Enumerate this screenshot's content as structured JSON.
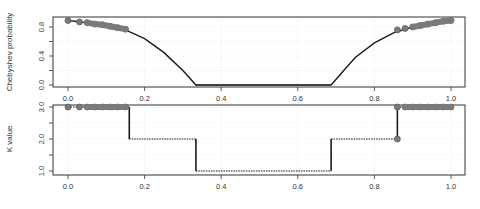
{
  "chart_data": [
    {
      "type": "line",
      "panel": "top",
      "title": "",
      "xlabel": "",
      "ylabel": "Chebyshev probability",
      "xlim": [
        -0.04,
        1.04
      ],
      "ylim": [
        0.0,
        0.9
      ],
      "x_ticks": [
        "0.0",
        "0.2",
        "0.4",
        "0.6",
        "0.8",
        "1.0"
      ],
      "y_ticks": [
        "0.0",
        "0.4",
        "0.8"
      ],
      "y_minor_ticks": [
        0.2,
        0.6
      ],
      "grid": true,
      "series": [
        {
          "name": "Chebyshev probability curve",
          "style": "solid",
          "x": [
            0.0,
            0.05,
            0.1,
            0.15,
            0.2,
            0.25,
            0.3,
            0.334,
            0.4,
            0.5,
            0.6,
            0.687,
            0.72,
            0.75,
            0.8,
            0.85,
            0.9,
            0.95,
            1.0
          ],
          "y": [
            0.89,
            0.86,
            0.82,
            0.76,
            0.64,
            0.45,
            0.2,
            0.0,
            0.0,
            0.0,
            0.0,
            0.0,
            0.2,
            0.38,
            0.58,
            0.72,
            0.8,
            0.86,
            0.89
          ]
        },
        {
          "name": "zero segment",
          "style": "dotted",
          "x": [
            0.334,
            0.687
          ],
          "y": [
            0.0,
            0.0
          ]
        },
        {
          "name": "sample points (left)",
          "style": "markers",
          "x": [
            0.0,
            0.03,
            0.05,
            0.07,
            0.09,
            0.11,
            0.13,
            0.15
          ],
          "y": [
            0.89,
            0.87,
            0.86,
            0.84,
            0.83,
            0.81,
            0.79,
            0.77
          ]
        },
        {
          "name": "sample points (right)",
          "style": "markers",
          "x": [
            0.86,
            0.88,
            0.9,
            0.92,
            0.94,
            0.96,
            0.98,
            1.0
          ],
          "y": [
            0.76,
            0.78,
            0.8,
            0.82,
            0.84,
            0.86,
            0.88,
            0.89
          ]
        }
      ]
    },
    {
      "type": "line",
      "panel": "bottom",
      "title": "",
      "xlabel": "",
      "ylabel": "K value",
      "xlim": [
        -0.04,
        1.04
      ],
      "ylim": [
        1.0,
        3.0
      ],
      "x_ticks": [
        "0.0",
        "0.2",
        "0.4",
        "0.6",
        "0.8",
        "1.0"
      ],
      "y_ticks": [
        "1.0",
        "2.0",
        "3.0"
      ],
      "y_minor_ticks": [
        1.5,
        2.5
      ],
      "grid": true,
      "series": [
        {
          "name": "K step function",
          "style": "step",
          "x": [
            0.0,
            0.16,
            0.16,
            0.334,
            0.334,
            0.687,
            0.687,
            0.86,
            0.86,
            1.0
          ],
          "y": [
            3,
            3,
            2,
            2,
            1,
            1,
            2,
            2,
            3,
            3
          ]
        },
        {
          "name": "sample points (left)",
          "style": "markers",
          "x": [
            0.0,
            0.03,
            0.05,
            0.07,
            0.09,
            0.11,
            0.13,
            0.15
          ],
          "y": [
            3,
            3,
            3,
            3,
            3,
            3,
            3,
            3
          ]
        },
        {
          "name": "sample points (right)",
          "style": "markers",
          "x": [
            0.86,
            0.86,
            0.88,
            0.9,
            0.92,
            0.94,
            0.96,
            0.98,
            1.0
          ],
          "y": [
            2,
            3,
            3,
            3,
            3,
            3,
            3,
            3,
            3
          ]
        }
      ]
    }
  ],
  "panels": {
    "top": {
      "ylabel": "Chebyshev probability",
      "y_ticks": [
        "0.8",
        "0.4",
        "0.0"
      ]
    },
    "bottom": {
      "ylabel": "K value",
      "y_ticks": [
        "3.0",
        "2.0",
        "1.0"
      ]
    },
    "x_ticks": [
      "0.0",
      "0.2",
      "0.4",
      "0.6",
      "0.8",
      "1.0"
    ]
  },
  "colors": {
    "line": "#1a1a1a",
    "marker_fill": "#7a7a7a",
    "marker_edge": "#555555",
    "frame": "#333333",
    "grid": "#e6e6e6",
    "text": "#333333"
  }
}
